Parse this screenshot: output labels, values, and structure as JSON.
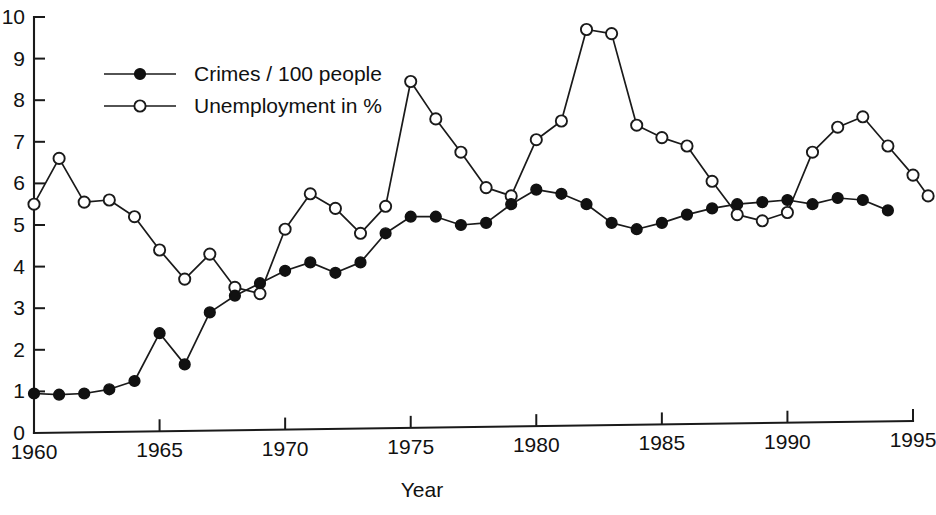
{
  "chart_data": {
    "type": "line",
    "title": "",
    "subtitle": "",
    "xlabel": "Year",
    "ylabel": "",
    "xlim": [
      1960,
      1995
    ],
    "ylim": [
      0,
      10
    ],
    "grid": false,
    "legend_position": "top-left",
    "x_ticks": [
      1960,
      1965,
      1970,
      1975,
      1980,
      1985,
      1990,
      1995
    ],
    "x_tick_labels": [
      "1960",
      "1965",
      "1970",
      "1975",
      "1980",
      "1985",
      "1990",
      "1995"
    ],
    "y_ticks": [
      0,
      1,
      2,
      3,
      4,
      5,
      6,
      7,
      8,
      9,
      10
    ],
    "y_tick_labels": [
      "0",
      "1",
      "2",
      "3",
      "4",
      "5",
      "6",
      "7",
      "8",
      "9",
      "10"
    ],
    "x": [
      1960,
      1961,
      1962,
      1963,
      1964,
      1965,
      1966,
      1967,
      1968,
      1969,
      1970,
      1971,
      1972,
      1973,
      1974,
      1975,
      1976,
      1977,
      1978,
      1979,
      1980,
      1981,
      1982,
      1983,
      1984,
      1985,
      1986,
      1987,
      1988,
      1989,
      1990,
      1991,
      1992,
      1993,
      1994
    ],
    "series": [
      {
        "name": "Crimes / 100 people",
        "marker": "filled-circle",
        "values": [
          0.95,
          0.92,
          0.95,
          1.05,
          1.25,
          2.4,
          1.65,
          2.9,
          3.3,
          3.6,
          3.9,
          4.1,
          3.85,
          4.1,
          4.8,
          5.2,
          5.2,
          5.0,
          5.05,
          5.5,
          5.85,
          5.75,
          5.5,
          5.05,
          4.9,
          5.05,
          5.25,
          5.4,
          5.5,
          5.55,
          5.6,
          5.5,
          5.65,
          5.6,
          5.35
        ]
      },
      {
        "name": "Unemployment in %",
        "marker": "open-circle",
        "values": [
          5.5,
          6.6,
          5.55,
          5.6,
          5.2,
          4.4,
          3.7,
          4.3,
          3.5,
          3.35,
          4.9,
          5.75,
          5.4,
          4.8,
          5.45,
          8.45,
          7.55,
          6.75,
          5.9,
          5.7,
          7.05,
          7.5,
          9.7,
          9.6,
          7.4,
          7.1,
          6.9,
          6.05,
          5.25,
          5.1,
          5.3,
          6.75,
          7.35,
          7.6,
          6.9
        ]
      }
    ],
    "extra_points": [
      {
        "series": "Unemployment in %",
        "x": 1995,
        "value": 6.2
      },
      {
        "series": "Unemployment in %",
        "x": 1995.6,
        "value": 5.7
      }
    ],
    "legend": [
      {
        "label": "Crimes / 100 people",
        "marker": "filled-circle"
      },
      {
        "label": "Unemployment in %",
        "marker": "open-circle"
      }
    ],
    "colors": {
      "axis": "#1a1a1a",
      "series_crimes": "#111111",
      "series_unemployment": "#ffffff",
      "background": "#ffffff"
    }
  }
}
